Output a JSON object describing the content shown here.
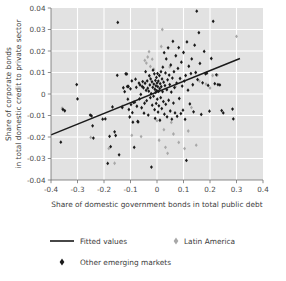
{
  "chart_data": {
    "type": "scatter",
    "title": "",
    "xlabel": "Share of domestic government bonds in total public debt",
    "ylabel_line1": "Share of corporate bonds",
    "ylabel_line2": "in total domestic credit to private sector",
    "xlim": [
      -0.4,
      0.4
    ],
    "ylim": [
      -0.04,
      0.04
    ],
    "xticks": [
      -0.4,
      -0.3,
      -0.2,
      -0.1,
      0,
      0.1,
      0.2,
      0.3,
      0.4
    ],
    "xticklabels": [
      "-0.4",
      "-0.3",
      "-0.2",
      "-0.1",
      "0",
      "0.1",
      "0.2",
      "0.3",
      "0.4"
    ],
    "yticks": [
      -0.04,
      -0.03,
      -0.02,
      -0.01,
      0,
      0.01,
      0.02,
      0.03,
      0.04
    ],
    "yticklabels": [
      "-0.04",
      "-0.03",
      "-0.02",
      "-0.01",
      "0",
      "0.01",
      "0.02",
      "0.03",
      "0.04"
    ],
    "grid": true,
    "grid_color": "#ffffff",
    "plot_background": "#e2e2e2",
    "legend_position": "below",
    "legend": [
      {
        "label": "Fitted values",
        "marker": "line",
        "color": "#1a1a1a"
      },
      {
        "label": "Latin America",
        "marker": "diamond",
        "color": "#a8a8a8"
      },
      {
        "label": "Other emerging markets",
        "marker": "diamond",
        "color": "#1a1a1a"
      }
    ],
    "fit_line": {
      "name": "Fitted values",
      "color": "#1a1a1a",
      "x_start": -0.4,
      "y_start": -0.019,
      "x_end": 0.313,
      "y_end": 0.0165,
      "slope": 0.0498,
      "intercept": 0.0009
    },
    "series": [
      {
        "name": "Other emerging markets",
        "color": "#1a1a1a",
        "marker": "diamond",
        "points": [
          [
            -0.363,
            -0.0224
          ],
          [
            -0.355,
            -0.0072
          ],
          [
            -0.348,
            -0.0078
          ],
          [
            -0.303,
            0.0044
          ],
          [
            -0.3,
            -0.0023
          ],
          [
            -0.252,
            -0.0098
          ],
          [
            -0.247,
            -0.0102
          ],
          [
            -0.243,
            -0.0148
          ],
          [
            -0.24,
            -0.0205
          ],
          [
            -0.205,
            -0.0117
          ],
          [
            -0.195,
            -0.0116
          ],
          [
            -0.186,
            -0.0323
          ],
          [
            -0.179,
            -0.0197
          ],
          [
            -0.175,
            -0.0245
          ],
          [
            -0.168,
            -0.006
          ],
          [
            -0.16,
            -0.0176
          ],
          [
            -0.156,
            -0.0193
          ],
          [
            -0.15,
            0.0087
          ],
          [
            -0.148,
            0.0333
          ],
          [
            -0.143,
            -0.0283
          ],
          [
            -0.131,
            -0.0063
          ],
          [
            -0.127,
            0.0029
          ],
          [
            -0.122,
            0.0011
          ],
          [
            -0.118,
            0.0094
          ],
          [
            -0.114,
            0.0093
          ],
          [
            -0.112,
            0.0035
          ],
          [
            -0.11,
            -0.0024
          ],
          [
            -0.108,
            0.0035
          ],
          [
            -0.106,
            -0.0072
          ],
          [
            -0.103,
            -0.0107
          ],
          [
            -0.1,
            0.0024
          ],
          [
            -0.098,
            -0.0049
          ],
          [
            -0.095,
            0.0061
          ],
          [
            -0.093,
            -0.0087
          ],
          [
            -0.091,
            -0.0131
          ],
          [
            -0.089,
            -0.0039
          ],
          [
            -0.086,
            -0.0248
          ],
          [
            -0.084,
            -0.0038
          ],
          [
            -0.081,
            0.0069
          ],
          [
            -0.078,
            0.0031
          ],
          [
            -0.076,
            -0.0057
          ],
          [
            -0.073,
            -0.0128
          ],
          [
            -0.071,
            -0.013
          ],
          [
            -0.068,
            0.0051
          ],
          [
            -0.066,
            -0.0023
          ],
          [
            -0.064,
            0.0042
          ],
          [
            -0.061,
            -0.0002
          ],
          [
            -0.058,
            -0.0064
          ],
          [
            -0.056,
            0.0035
          ],
          [
            -0.054,
            0.0058
          ],
          [
            -0.051,
            0.0029
          ],
          [
            -0.049,
            -0.0089
          ],
          [
            -0.047,
            -0.0043
          ],
          [
            -0.045,
            0.005
          ],
          [
            -0.043,
            0.0104
          ],
          [
            -0.041,
            0.0017
          ],
          [
            -0.039,
            -0.0031
          ],
          [
            -0.037,
            0.0061
          ],
          [
            -0.035,
            0.0027
          ],
          [
            -0.033,
            -0.0098
          ],
          [
            -0.031,
            0.0013
          ],
          [
            -0.029,
            0.0085
          ],
          [
            -0.027,
            0.0042
          ],
          [
            -0.025,
            -0.0017
          ],
          [
            -0.024,
            0.007
          ],
          [
            -0.022,
            0.0002
          ],
          [
            -0.021,
            -0.034
          ],
          [
            -0.019,
            0.0057
          ],
          [
            -0.018,
            -0.0052
          ],
          [
            -0.016,
            0.0031
          ],
          [
            -0.015,
            0.0111
          ],
          [
            -0.013,
            -0.001
          ],
          [
            -0.012,
            0.0046
          ],
          [
            -0.01,
            0.0094
          ],
          [
            -0.009,
            -0.0073
          ],
          [
            -0.008,
            0.0022
          ],
          [
            -0.007,
            -0.0113
          ],
          [
            -0.006,
            0.0063
          ],
          [
            -0.005,
            0.0008
          ],
          [
            -0.004,
            0.0038
          ],
          [
            -0.003,
            -0.0044
          ],
          [
            -0.002,
            0.0077
          ],
          [
            -0.001,
            0.0016
          ],
          [
            0.0,
            0.0051
          ],
          [
            0.001,
            -0.0024
          ],
          [
            0.002,
            0.0095
          ],
          [
            0.003,
            0.0034
          ],
          [
            0.004,
            -0.0084
          ],
          [
            0.005,
            0.006
          ],
          [
            0.006,
            0.0012
          ],
          [
            0.007,
            -0.0055
          ],
          [
            0.009,
            0.0086
          ],
          [
            0.01,
            0.0025
          ],
          [
            0.011,
            -0.0122
          ],
          [
            0.012,
            0.0048
          ],
          [
            0.014,
            -0.0017
          ],
          [
            0.015,
            0.0104
          ],
          [
            0.016,
            0.0034
          ],
          [
            0.018,
            -0.0068
          ],
          [
            0.019,
            0.007
          ],
          [
            0.021,
            0.0011
          ],
          [
            0.022,
            0.0125
          ],
          [
            0.024,
            -0.0035
          ],
          [
            0.025,
            0.0055
          ],
          [
            0.027,
            0.0192
          ],
          [
            0.028,
            -0.0094
          ],
          [
            0.03,
            0.0039
          ],
          [
            0.032,
            0.0098
          ],
          [
            0.033,
            -0.0048
          ],
          [
            0.035,
            0.0163
          ],
          [
            0.037,
            0.002
          ],
          [
            0.038,
            -0.0106
          ],
          [
            0.04,
            0.0066
          ],
          [
            0.042,
            0.0215
          ],
          [
            0.044,
            -0.0029
          ],
          [
            0.046,
            0.0088
          ],
          [
            0.048,
            0.0044
          ],
          [
            0.05,
            -0.0079
          ],
          [
            0.052,
            0.0135
          ],
          [
            0.054,
            0.0009
          ],
          [
            0.056,
            -0.0117
          ],
          [
            0.058,
            0.0074
          ],
          [
            0.06,
            0.0245
          ],
          [
            0.062,
            -0.0042
          ],
          [
            0.064,
            0.0104
          ],
          [
            0.066,
            0.003
          ],
          [
            0.068,
            -0.0088
          ],
          [
            0.071,
            0.0178
          ],
          [
            0.074,
            0.0051
          ],
          [
            0.076,
            -0.0104
          ],
          [
            0.079,
            0.0119
          ],
          [
            0.082,
            0.0216
          ],
          [
            0.084,
            -0.0021
          ],
          [
            0.087,
            0.0072
          ],
          [
            0.09,
            -0.0091
          ],
          [
            0.092,
            0.0148
          ],
          [
            0.095,
            0.0037
          ],
          [
            0.098,
            -0.0075
          ],
          [
            0.1,
            0.0193
          ],
          [
            0.103,
            0.006
          ],
          [
            0.106,
            -0.0118
          ],
          [
            0.108,
            0.0086
          ],
          [
            0.111,
            -0.0309
          ],
          [
            0.113,
            0.0242
          ],
          [
            0.117,
            0.0018
          ],
          [
            0.12,
            0.0129
          ],
          [
            0.124,
            -0.0046
          ],
          [
            0.128,
            0.0095
          ],
          [
            0.131,
            0.0163
          ],
          [
            0.135,
            0.0043
          ],
          [
            0.138,
            -0.0083
          ],
          [
            0.142,
            0.0227
          ],
          [
            0.146,
            0.01
          ],
          [
            0.15,
            0.0385
          ],
          [
            0.153,
            0.0067
          ],
          [
            0.158,
            0.0285
          ],
          [
            0.162,
            0.0142
          ],
          [
            0.167,
            -0.0095
          ],
          [
            0.172,
            0.0052
          ],
          [
            0.178,
            0.0198
          ],
          [
            0.183,
            0.0094
          ],
          [
            0.188,
            0.0097
          ],
          [
            0.193,
            0.004
          ],
          [
            0.198,
            -0.008
          ],
          [
            0.205,
            0.0165
          ],
          [
            0.212,
            0.0338
          ],
          [
            0.218,
            0.0048
          ],
          [
            0.224,
            0.0089
          ],
          [
            0.23,
            0.0044
          ],
          [
            0.237,
            0.0042
          ],
          [
            0.244,
            -0.0077
          ],
          [
            0.25,
            -0.0088
          ],
          [
            0.285,
            -0.007
          ],
          [
            0.288,
            -0.0116
          ]
        ]
      },
      {
        "name": "Latin America",
        "color": "#a8a8a8",
        "marker": "diamond",
        "points": [
          [
            -0.358,
            -0.0066
          ],
          [
            -0.25,
            -0.0202
          ],
          [
            -0.182,
            -0.0253
          ],
          [
            -0.16,
            -0.0322
          ],
          [
            -0.13,
            -0.0056
          ],
          [
            -0.095,
            -0.0192
          ],
          [
            -0.06,
            -0.0198
          ],
          [
            -0.046,
            0.0156
          ],
          [
            -0.04,
            0.0144
          ],
          [
            -0.035,
            0.0172
          ],
          [
            -0.03,
            0.0197
          ],
          [
            -0.025,
            0.0128
          ],
          [
            -0.018,
            0.0162
          ],
          [
            -0.012,
            0.0115
          ],
          [
            0.0,
            -0.0124
          ],
          [
            0.008,
            -0.0215
          ],
          [
            0.016,
            0.0221
          ],
          [
            0.02,
            0.03
          ],
          [
            0.026,
            -0.0166
          ],
          [
            0.032,
            -0.0248
          ],
          [
            0.04,
            -0.0276
          ],
          [
            0.048,
            0.0126
          ],
          [
            0.054,
            -0.0132
          ],
          [
            0.062,
            -0.0186
          ],
          [
            0.07,
            0.0035
          ],
          [
            0.082,
            -0.0225
          ],
          [
            0.104,
            -0.0254
          ],
          [
            0.118,
            -0.0172
          ],
          [
            0.13,
            -0.0063
          ],
          [
            0.148,
            -0.0238
          ],
          [
            0.16,
            0.006
          ],
          [
            0.185,
            0.0046
          ],
          [
            0.2,
            0.0028
          ],
          [
            0.21,
            0.0086
          ],
          [
            0.228,
            0.0088
          ],
          [
            0.3,
            0.0268
          ]
        ]
      }
    ]
  }
}
